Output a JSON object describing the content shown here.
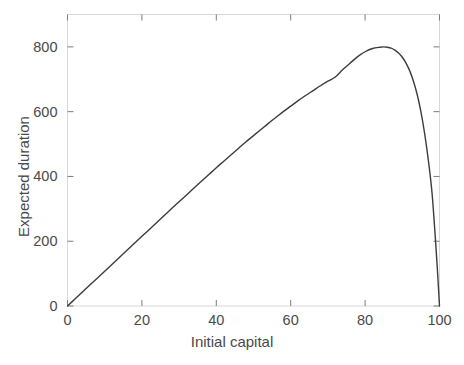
{
  "figure": {
    "background_color": "#ffffff",
    "axis_color": "#d8d8d8",
    "curve_color": "#3c3c3c",
    "text_color": "#4a4a4a"
  },
  "chart_data": {
    "type": "line",
    "title": "",
    "xlabel": "Initial capital",
    "ylabel": "Expected duration",
    "xlim": [
      0,
      100
    ],
    "ylim": [
      0,
      900
    ],
    "xticks": [
      0,
      20,
      40,
      60,
      80,
      100
    ],
    "xtick_labels": [
      "0",
      "20",
      "40",
      "60",
      "80",
      "100"
    ],
    "yticks": [
      0,
      200,
      400,
      600,
      800
    ],
    "ytick_labels": [
      "0",
      "200",
      "400",
      "600",
      "800"
    ],
    "grid": false,
    "legend": null,
    "annotations": [],
    "series": [
      {
        "name": "Expected duration",
        "color": "#3c3c3c",
        "line_width": 1.4,
        "x": [
          0,
          2,
          4,
          6,
          8,
          10,
          12,
          14,
          16,
          18,
          20,
          22,
          24,
          26,
          28,
          30,
          32,
          34,
          36,
          38,
          40,
          42,
          44,
          46,
          48,
          50,
          52,
          54,
          56,
          58,
          60,
          62,
          64,
          66,
          68,
          70,
          72,
          74,
          76,
          78,
          80,
          82,
          84,
          85,
          86,
          87,
          88,
          89,
          90,
          91,
          92,
          93,
          94,
          95,
          96,
          97,
          98,
          99,
          99.5,
          100
        ],
        "y": [
          0,
          21.5,
          43,
          64.5,
          86,
          107.5,
          129,
          150.5,
          172,
          193.5,
          215,
          236.5,
          258,
          279.5,
          301,
          322,
          343,
          364,
          385,
          406,
          427,
          447,
          467,
          487,
          507,
          526,
          545,
          564,
          582,
          600,
          617,
          634,
          650,
          665,
          680,
          694,
          707,
          730,
          750,
          770,
          785,
          795,
          799,
          800,
          799,
          796,
          790,
          781,
          768,
          750,
          726,
          694,
          653,
          600,
          533,
          450,
          348,
          190,
          100,
          0
        ]
      }
    ]
  }
}
